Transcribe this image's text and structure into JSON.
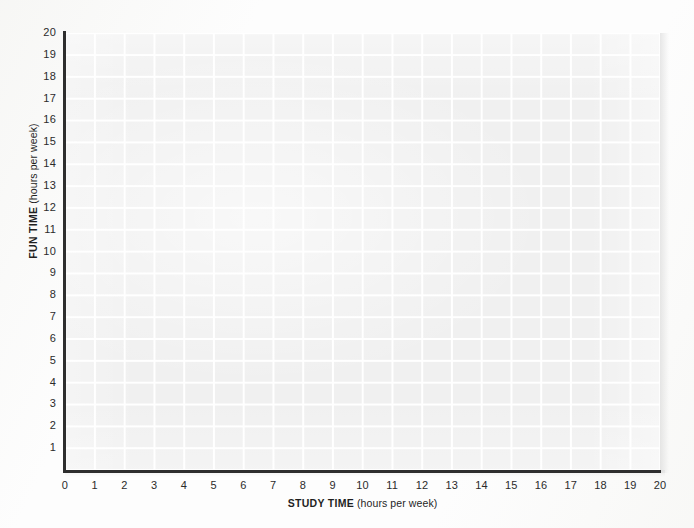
{
  "chart_data": {
    "type": "scatter",
    "title": "",
    "xlabel": "STUDY TIME",
    "xlabel_units": "(hours per week)",
    "ylabel": "FUN TIME",
    "ylabel_units": "(hours per week)",
    "xlim": [
      0,
      20
    ],
    "ylim": [
      0,
      20
    ],
    "x_ticks": [
      "0",
      "1",
      "2",
      "3",
      "4",
      "5",
      "6",
      "7",
      "8",
      "9",
      "10",
      "11",
      "12",
      "13",
      "14",
      "15",
      "16",
      "17",
      "18",
      "19",
      "20"
    ],
    "y_ticks": [
      "1",
      "2",
      "3",
      "4",
      "5",
      "6",
      "7",
      "8",
      "9",
      "10",
      "11",
      "12",
      "13",
      "14",
      "15",
      "16",
      "17",
      "18",
      "19",
      "20"
    ],
    "x_tick_values": [
      0,
      1,
      2,
      3,
      4,
      5,
      6,
      7,
      8,
      9,
      10,
      11,
      12,
      13,
      14,
      15,
      16,
      17,
      18,
      19,
      20
    ],
    "y_tick_values": [
      1,
      2,
      3,
      4,
      5,
      6,
      7,
      8,
      9,
      10,
      11,
      12,
      13,
      14,
      15,
      16,
      17,
      18,
      19,
      20
    ],
    "series": [],
    "values": [],
    "grid": true,
    "grid_color": "#ffffff",
    "plot_background": "#f0f0f0",
    "axis_color": "#2e2e2e",
    "legend": null,
    "legend_position": "none",
    "annotations": []
  },
  "colors": {
    "page_background": "#fdfdfd",
    "plot_fill": "#f0f0f0",
    "gridline": "#ffffff",
    "axis": "#2e2e2e",
    "tick_text": "#2b2b2b"
  }
}
